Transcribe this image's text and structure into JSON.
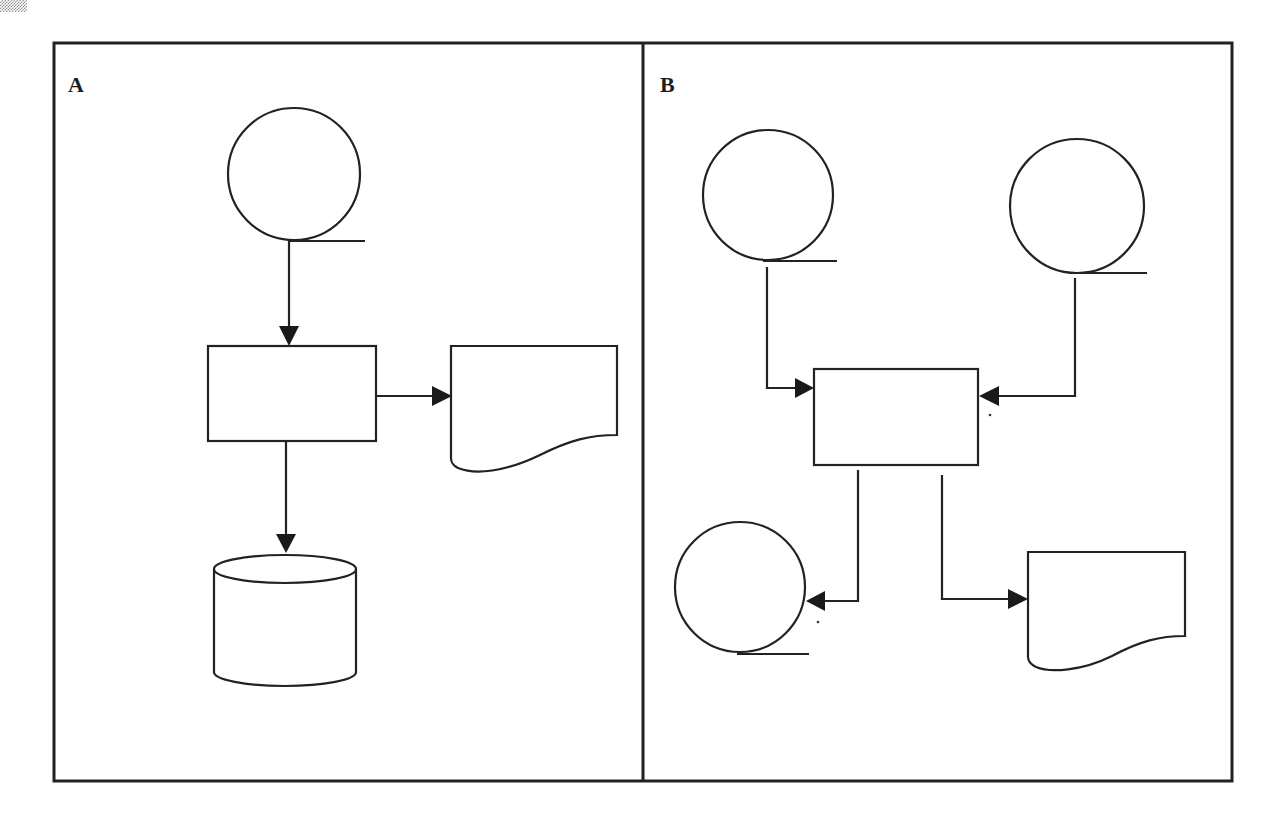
{
  "figure": {
    "panels": [
      {
        "id": "A",
        "label": "A",
        "nodes": [
          {
            "id": "a-tape-in",
            "type": "magnetic-tape",
            "label": ""
          },
          {
            "id": "a-process",
            "type": "process",
            "label": ""
          },
          {
            "id": "a-document",
            "type": "document",
            "label": ""
          },
          {
            "id": "a-storage",
            "type": "disk-storage",
            "label": ""
          }
        ],
        "edges": [
          {
            "from": "a-tape-in",
            "to": "a-process"
          },
          {
            "from": "a-process",
            "to": "a-document"
          },
          {
            "from": "a-process",
            "to": "a-storage"
          }
        ]
      },
      {
        "id": "B",
        "label": "B",
        "nodes": [
          {
            "id": "b-tape-in-1",
            "type": "magnetic-tape",
            "label": ""
          },
          {
            "id": "b-tape-in-2",
            "type": "magnetic-tape",
            "label": ""
          },
          {
            "id": "b-process",
            "type": "process",
            "label": ""
          },
          {
            "id": "b-tape-out",
            "type": "magnetic-tape",
            "label": ""
          },
          {
            "id": "b-document",
            "type": "document",
            "label": ""
          }
        ],
        "edges": [
          {
            "from": "b-tape-in-1",
            "to": "b-process"
          },
          {
            "from": "b-tape-in-2",
            "to": "b-process"
          },
          {
            "from": "b-process",
            "to": "b-tape-out"
          },
          {
            "from": "b-process",
            "to": "b-document"
          }
        ]
      }
    ],
    "colors": {
      "line": "#222222",
      "background": "#ffffff"
    }
  }
}
